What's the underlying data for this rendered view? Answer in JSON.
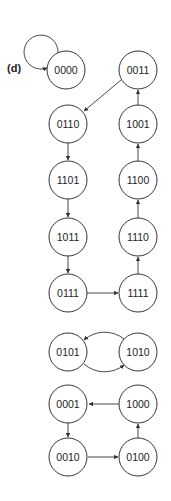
{
  "figure": {
    "panel_label": "(d)",
    "colors": {
      "stroke": "#333333",
      "text": "#222222",
      "background": "#ffffff"
    }
  },
  "nodes": [
    {
      "id": "0000",
      "label": "0000",
      "x": 66,
      "y": 70
    },
    {
      "id": "0011",
      "label": "0011",
      "x": 138,
      "y": 70
    },
    {
      "id": "0110",
      "label": "0110",
      "x": 68,
      "y": 124
    },
    {
      "id": "1001",
      "label": "1001",
      "x": 138,
      "y": 124
    },
    {
      "id": "1101",
      "label": "1101",
      "x": 68,
      "y": 180
    },
    {
      "id": "1100",
      "label": "1100",
      "x": 138,
      "y": 180
    },
    {
      "id": "1011",
      "label": "1011",
      "x": 68,
      "y": 237
    },
    {
      "id": "1110",
      "label": "1110",
      "x": 138,
      "y": 237
    },
    {
      "id": "0111",
      "label": "0111",
      "x": 68,
      "y": 293
    },
    {
      "id": "1111",
      "label": "1111",
      "x": 138,
      "y": 293
    },
    {
      "id": "0101",
      "label": "0101",
      "x": 68,
      "y": 352
    },
    {
      "id": "1010",
      "label": "1010",
      "x": 138,
      "y": 352
    },
    {
      "id": "0001",
      "label": "0001",
      "x": 68,
      "y": 404
    },
    {
      "id": "1000",
      "label": "1000",
      "x": 138,
      "y": 404
    },
    {
      "id": "0010",
      "label": "0010",
      "x": 68,
      "y": 457
    },
    {
      "id": "0100",
      "label": "0100",
      "x": 138,
      "y": 457
    }
  ],
  "edges": [
    {
      "from": "0000",
      "to": "0000",
      "type": "self-loop"
    },
    {
      "from": "0011",
      "to": "0110"
    },
    {
      "from": "0110",
      "to": "1101"
    },
    {
      "from": "1101",
      "to": "1011"
    },
    {
      "from": "1011",
      "to": "0111"
    },
    {
      "from": "0111",
      "to": "1111"
    },
    {
      "from": "1111",
      "to": "1110"
    },
    {
      "from": "1110",
      "to": "1100"
    },
    {
      "from": "1100",
      "to": "1001"
    },
    {
      "from": "1001",
      "to": "0011"
    },
    {
      "from": "1010",
      "to": "0101",
      "type": "arc-top"
    },
    {
      "from": "0101",
      "to": "1010",
      "type": "arc-bottom"
    },
    {
      "from": "1000",
      "to": "0001"
    },
    {
      "from": "0001",
      "to": "0010"
    },
    {
      "from": "0010",
      "to": "0100"
    },
    {
      "from": "0100",
      "to": "1000"
    }
  ]
}
